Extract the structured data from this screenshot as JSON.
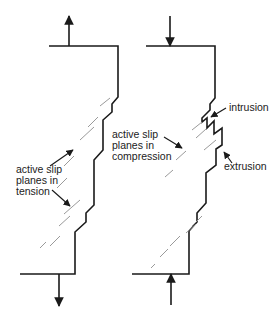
{
  "diagram": {
    "colors": {
      "line": "#1a1a1a",
      "slip": "#9a9a9a",
      "background": "#ffffff"
    },
    "panels": [
      {
        "name": "tension",
        "load": "tension",
        "labels": {
          "l1": "active slip",
          "l2": "planes in",
          "l3": "tension"
        }
      },
      {
        "name": "compression",
        "load": "compression",
        "labels": {
          "l1": "active slip",
          "l2": "planes in",
          "l3": "compression"
        },
        "callouts": {
          "intrusion": "intrusion",
          "extrusion": "extrusion"
        }
      }
    ]
  }
}
